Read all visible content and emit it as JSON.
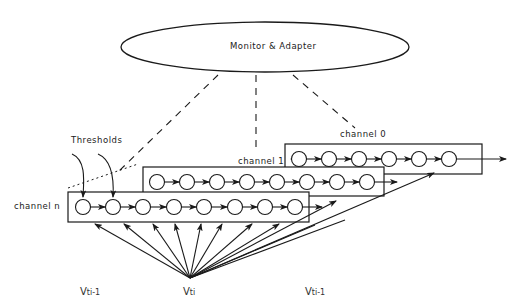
{
  "diagram": {
    "monitor": {
      "label": "Monitor & Adapter"
    },
    "annotations": {
      "thresholds": "Thresholds"
    },
    "channels": [
      {
        "label": "channel 0",
        "neurons": 6
      },
      {
        "label": "channel 1",
        "neurons": 8
      },
      {
        "label": "channel n",
        "neurons": 8
      }
    ],
    "inputs": {
      "left": {
        "base": "V",
        "sub": "ti-1"
      },
      "center": {
        "base": "V",
        "sub": "ti"
      },
      "right": {
        "base": "V",
        "sub": "ti-1"
      }
    },
    "colors": {
      "stroke": "#1a1a1a",
      "background": "#ffffff"
    }
  }
}
